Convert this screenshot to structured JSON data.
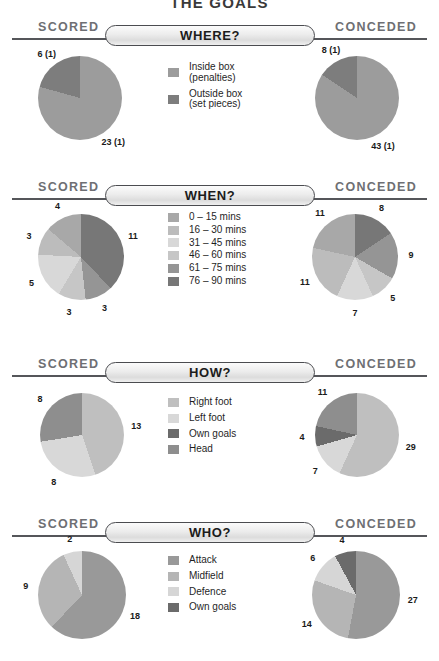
{
  "title": "THE GOALS",
  "palette": {
    "shade1": "#9a9a9a",
    "shade2": "#b0b0b0",
    "shade3": "#d2d2d2",
    "shade4": "#c0c0c0",
    "shade5": "#8d8d8d",
    "shade6": "#6f6f6f",
    "light": "#cfcfcf",
    "mid": "#9c9c9c",
    "dark": "#6b6b6b",
    "rule": "#55565a",
    "side_label": "#6e6f73"
  },
  "labels": {
    "scored": "SCORED",
    "conceded": "CONCEDED"
  },
  "sections": [
    {
      "id": "where",
      "banner": "WHERE?",
      "legend": [
        {
          "label": "Inside box\n(penalties)",
          "color": "#9c9c9c"
        },
        {
          "label": "Outside box\n(set pieces)",
          "color": "#7d7d7d"
        }
      ],
      "scored": {
        "total": 29,
        "slices": [
          {
            "label": "23 (1)",
            "value": 23,
            "color": "#9c9c9c"
          },
          {
            "label": "6 (1)",
            "value": 6,
            "color": "#7d7d7d"
          }
        ]
      },
      "conceded": {
        "total": 51,
        "slices": [
          {
            "label": "43 (1)",
            "value": 43,
            "color": "#9c9c9c"
          },
          {
            "label": "8 (1)",
            "value": 8,
            "color": "#7d7d7d"
          }
        ]
      }
    },
    {
      "id": "when",
      "banner": "WHEN?",
      "legend": [
        {
          "label": "0 – 15 mins",
          "color": "#a8a8a8"
        },
        {
          "label": "16 – 30 mins",
          "color": "#bcbcbc"
        },
        {
          "label": "31 – 45 mins",
          "color": "#d8d8d8"
        },
        {
          "label": "46 – 60 mins",
          "color": "#c6c6c6"
        },
        {
          "label": "61 – 75 mins",
          "color": "#959595"
        },
        {
          "label": "76 – 90 mins",
          "color": "#777777"
        }
      ],
      "scored": {
        "total": 29,
        "slices": [
          {
            "label": "11",
            "value": 11,
            "color": "#777777"
          },
          {
            "label": "3",
            "value": 3,
            "color": "#959595"
          },
          {
            "label": "3",
            "value": 3,
            "color": "#c6c6c6"
          },
          {
            "label": "5",
            "value": 5,
            "color": "#d8d8d8"
          },
          {
            "label": "3",
            "value": 3,
            "color": "#bcbcbc"
          },
          {
            "label": "4",
            "value": 4,
            "color": "#a8a8a8"
          }
        ]
      },
      "conceded": {
        "total": 51,
        "slices": [
          {
            "label": "8",
            "value": 8,
            "color": "#777777"
          },
          {
            "label": "9",
            "value": 9,
            "color": "#959595"
          },
          {
            "label": "5",
            "value": 5,
            "color": "#c6c6c6"
          },
          {
            "label": "7",
            "value": 7,
            "color": "#d8d8d8"
          },
          {
            "label": "11",
            "value": 11,
            "color": "#bcbcbc"
          },
          {
            "label": "11",
            "value": 11,
            "color": "#a8a8a8"
          }
        ]
      }
    },
    {
      "id": "how",
      "banner": "HOW?",
      "legend": [
        {
          "label": "Right foot",
          "color": "#bfbfbf"
        },
        {
          "label": "Left foot",
          "color": "#d8d8d8"
        },
        {
          "label": "Own goals",
          "color": "#6b6b6b"
        },
        {
          "label": "Head",
          "color": "#8e8e8e"
        }
      ],
      "scored": {
        "total": 29,
        "slices": [
          {
            "label": "13",
            "value": 13,
            "color": "#bfbfbf"
          },
          {
            "label": "8",
            "value": 8,
            "color": "#d8d8d8"
          },
          {
            "label": "8",
            "value": 8,
            "color": "#8e8e8e"
          }
        ]
      },
      "conceded": {
        "total": 51,
        "slices": [
          {
            "label": "29",
            "value": 29,
            "color": "#bfbfbf"
          },
          {
            "label": "7",
            "value": 7,
            "color": "#d8d8d8"
          },
          {
            "label": "4",
            "value": 4,
            "color": "#6b6b6b"
          },
          {
            "label": "11",
            "value": 11,
            "color": "#8e8e8e"
          }
        ]
      }
    },
    {
      "id": "who",
      "banner": "WHO?",
      "legend": [
        {
          "label": "Attack",
          "color": "#999999"
        },
        {
          "label": "Midfield",
          "color": "#b5b5b5"
        },
        {
          "label": "Defence",
          "color": "#d6d6d6"
        },
        {
          "label": "Own goals",
          "color": "#6b6b6b"
        }
      ],
      "scored": {
        "total": 29,
        "slices": [
          {
            "label": "18",
            "value": 18,
            "color": "#999999"
          },
          {
            "label": "9",
            "value": 9,
            "color": "#b5b5b5"
          },
          {
            "label": "2",
            "value": 2,
            "color": "#d6d6d6"
          }
        ]
      },
      "conceded": {
        "total": 51,
        "slices": [
          {
            "label": "27",
            "value": 27,
            "color": "#999999"
          },
          {
            "label": "14",
            "value": 14,
            "color": "#b5b5b5"
          },
          {
            "label": "6",
            "value": 6,
            "color": "#d6d6d6"
          },
          {
            "label": "4",
            "value": 4,
            "color": "#6b6b6b"
          }
        ]
      }
    }
  ],
  "chart_data": {
    "type": "pie",
    "title": "THE GOALS",
    "charts": [
      {
        "section": "WHERE?",
        "side": "SCORED",
        "categories": [
          "Inside box (penalties)",
          "Outside box (set pieces)"
        ],
        "values": [
          23,
          6
        ],
        "data_labels": [
          "23 (1)",
          "6 (1)"
        ],
        "total": 29
      },
      {
        "section": "WHERE?",
        "side": "CONCEDED",
        "categories": [
          "Inside box (penalties)",
          "Outside box (set pieces)"
        ],
        "values": [
          43,
          8
        ],
        "data_labels": [
          "43 (1)",
          "8 (1)"
        ],
        "total": 51
      },
      {
        "section": "WHEN?",
        "side": "SCORED",
        "categories": [
          "0 – 15 mins",
          "16 – 30 mins",
          "31 – 45 mins",
          "46 – 60 mins",
          "61 – 75 mins",
          "76 – 90 mins"
        ],
        "values": [
          4,
          3,
          5,
          3,
          3,
          11
        ],
        "total": 29
      },
      {
        "section": "WHEN?",
        "side": "CONCEDED",
        "categories": [
          "0 – 15 mins",
          "16 – 30 mins",
          "31 – 45 mins",
          "46 – 60 mins",
          "61 – 75 mins",
          "76 – 90 mins"
        ],
        "values": [
          11,
          11,
          7,
          5,
          9,
          8
        ],
        "total": 51
      },
      {
        "section": "HOW?",
        "side": "SCORED",
        "categories": [
          "Right foot",
          "Left foot",
          "Own goals",
          "Head"
        ],
        "values": [
          13,
          8,
          0,
          8
        ],
        "total": 29
      },
      {
        "section": "HOW?",
        "side": "CONCEDED",
        "categories": [
          "Right foot",
          "Left foot",
          "Own goals",
          "Head"
        ],
        "values": [
          29,
          7,
          4,
          11
        ],
        "total": 51
      },
      {
        "section": "WHO?",
        "side": "SCORED",
        "categories": [
          "Attack",
          "Midfield",
          "Defence",
          "Own goals"
        ],
        "values": [
          18,
          9,
          2,
          0
        ],
        "total": 29
      },
      {
        "section": "WHO?",
        "side": "CONCEDED",
        "categories": [
          "Attack",
          "Midfield",
          "Defence",
          "Own goals"
        ],
        "values": [
          27,
          14,
          6,
          4
        ],
        "total": 51
      }
    ]
  }
}
